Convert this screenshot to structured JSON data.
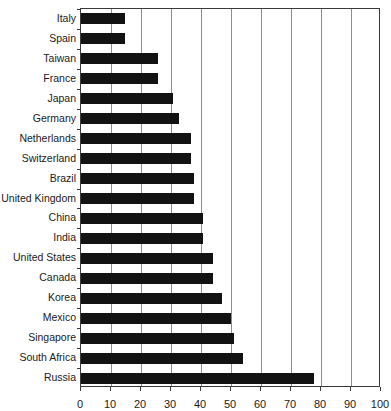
{
  "chart_data": {
    "type": "bar",
    "orientation": "horizontal",
    "title": "",
    "xlabel": "",
    "ylabel": "",
    "xlim": [
      0,
      100
    ],
    "xticks": [
      0,
      10,
      20,
      30,
      40,
      50,
      60,
      70,
      80,
      90,
      100
    ],
    "grid": true,
    "legend": null,
    "bar_color": "#121212",
    "categories": [
      "Italy",
      "Spain",
      "Taiwan",
      "France",
      "Japan",
      "Germany",
      "Netherlands",
      "Switzerland",
      "Brazil",
      "United Kingdom",
      "China",
      "India",
      "United States",
      "Canada",
      "Korea",
      "Mexico",
      "Singapore",
      "South Africa",
      "Russia"
    ],
    "values": [
      14.5,
      14.5,
      25.5,
      25.5,
      30.5,
      32.5,
      36.5,
      36.5,
      37.5,
      37.5,
      40.5,
      40.5,
      44,
      44,
      47,
      50,
      51,
      54,
      77.5
    ]
  },
  "axis": {
    "x_tick_labels": [
      "0",
      "10",
      "20",
      "30",
      "40",
      "50",
      "60",
      "70",
      "80",
      "90",
      "100"
    ]
  },
  "title_sliver": "",
  "colors": {
    "bar": "#121212",
    "frame": "#3a3a3a",
    "grid": "#8d8d8d",
    "text": "#1a1a1a",
    "background": "#ffffff"
  }
}
